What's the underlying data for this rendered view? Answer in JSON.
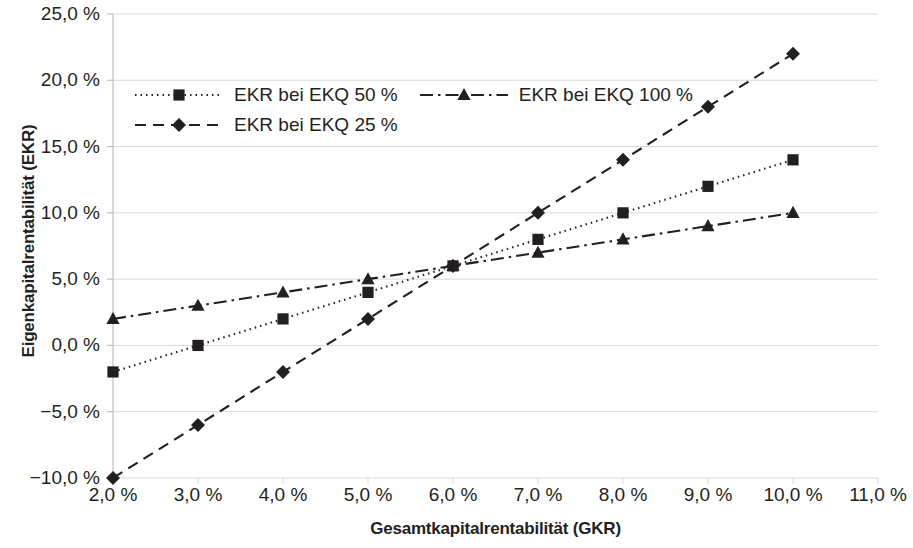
{
  "chart_data": {
    "type": "line",
    "title": "",
    "xlabel": "Gesamtkapitalrentabilität (GKR)",
    "ylabel": "Eigenkapitalrentabilität (EKR)",
    "x": [
      2.0,
      3.0,
      4.0,
      5.0,
      6.0,
      7.0,
      8.0,
      9.0,
      10.0
    ],
    "xlim": [
      2.0,
      11.0
    ],
    "ylim": [
      -10.0,
      25.0
    ],
    "xticks": [
      2.0,
      3.0,
      4.0,
      5.0,
      6.0,
      7.0,
      8.0,
      9.0,
      10.0,
      11.0
    ],
    "yticks": [
      -10.0,
      -5.0,
      0.0,
      5.0,
      10.0,
      15.0,
      20.0,
      25.0
    ],
    "xtick_labels": [
      "2,0 %",
      "3,0 %",
      "4,0 %",
      "5,0 %",
      "6,0 %",
      "7,0 %",
      "8,0 %",
      "9,0 %",
      "10,0 %",
      "11,0 %"
    ],
    "ytick_labels": [
      "−10,0 %",
      "−5,0 %",
      "0,0 %",
      "5,0 %",
      "10,0 %",
      "15,0 %",
      "20,0 %",
      "25,0 %"
    ],
    "grid": true,
    "legend_position": "upper-left-inside",
    "series": [
      {
        "name": "EKR bei EKQ 50 %",
        "marker": "square",
        "linestyle": "dotted",
        "color": "#231f20",
        "values": [
          -2.0,
          0.0,
          2.0,
          4.0,
          6.0,
          8.0,
          10.0,
          12.0,
          14.0
        ]
      },
      {
        "name": "EKR bei EKQ 25 %",
        "marker": "diamond",
        "linestyle": "dashed",
        "color": "#231f20",
        "values": [
          -10.0,
          -6.0,
          -2.0,
          2.0,
          6.0,
          10.0,
          14.0,
          18.0,
          22.0
        ]
      },
      {
        "name": "EKR bei EKQ 100 %",
        "marker": "triangle",
        "linestyle": "dashdot",
        "color": "#231f20",
        "values": [
          2.0,
          3.0,
          4.0,
          5.0,
          6.0,
          7.0,
          8.0,
          9.0,
          10.0
        ]
      }
    ]
  },
  "legend": {
    "rows": [
      [
        "EKR bei EKQ 50 %",
        "EKR bei EKQ 100 %"
      ],
      [
        "EKR bei EKQ 25 %"
      ]
    ]
  }
}
